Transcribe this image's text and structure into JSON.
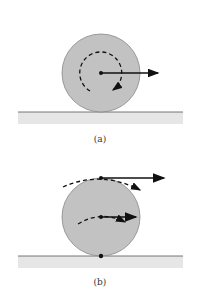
{
  "figure": {
    "panels": [
      {
        "id": "a",
        "label": "(a)",
        "description": "Wheel rolling: velocity of center, rotation about center"
      },
      {
        "id": "b",
        "label": "(b)",
        "description": "Velocity of top point is twice center velocity; contact point at rest"
      }
    ],
    "colors": {
      "wheel_fill": "#c2c2c2",
      "wheel_stroke": "#888888",
      "ground_fill": "#e6e6e6",
      "ground_line": "#555555",
      "arrow": "#111111"
    }
  }
}
